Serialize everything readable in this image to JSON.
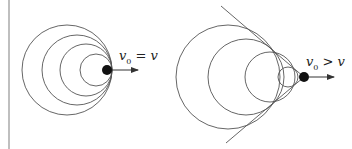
{
  "diagram": {
    "left_panel": {
      "label_main": "v",
      "label_sub": "0",
      "label_rest": " = v",
      "circles": [
        {
          "cx": 67,
          "cy": 70,
          "r": 45
        },
        {
          "cx": 77,
          "cy": 70,
          "r": 35
        },
        {
          "cx": 86,
          "cy": 70,
          "r": 26
        },
        {
          "cx": 96,
          "cy": 70,
          "r": 16
        }
      ],
      "source": {
        "cx": 107,
        "cy": 70,
        "r": 5
      },
      "arrow": {
        "x1": 112,
        "y1": 70,
        "x2": 138,
        "y2": 70
      }
    },
    "right_panel": {
      "label_main": "v",
      "label_sub": "0",
      "label_rest": " > v",
      "circles": [
        {
          "cx": 228,
          "cy": 77,
          "r": 52
        },
        {
          "cx": 246,
          "cy": 77,
          "r": 38
        },
        {
          "cx": 270,
          "cy": 77,
          "r": 25
        },
        {
          "cx": 288,
          "cy": 77,
          "r": 10
        }
      ],
      "source": {
        "cx": 304,
        "cy": 77,
        "r": 5
      },
      "arrow": {
        "x1": 309,
        "y1": 77,
        "x2": 334,
        "y2": 77
      },
      "cone_lines": [
        {
          "x1": 221,
          "y1": 6,
          "x2": 304,
          "y2": 77
        },
        {
          "x1": 226,
          "y1": 143,
          "x2": 304,
          "y2": 77
        }
      ]
    },
    "divider": {
      "x": 9,
      "y1": 0,
      "y2": 149
    },
    "colors": {
      "stroke": "#555555",
      "source": "#111111",
      "divider": "#aaaaaa"
    }
  }
}
